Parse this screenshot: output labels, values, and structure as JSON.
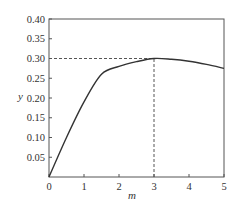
{
  "chart_data": {
    "type": "line",
    "title": "",
    "xlabel": "m",
    "ylabel": "y",
    "xlim": [
      0,
      5
    ],
    "ylim": [
      0,
      0.4
    ],
    "grid": false,
    "legend": null,
    "x_ticks": [
      "0",
      "1",
      "2",
      "3",
      "4",
      "5"
    ],
    "y_ticks": [
      "0.05",
      "0.10",
      "0.15",
      "0.20",
      "0.25",
      "0.30",
      "0.35",
      "0.40"
    ],
    "series": [
      {
        "name": "y(m)",
        "x": [
          0,
          0.5,
          1.0,
          1.5,
          2.0,
          2.5,
          3.0,
          3.5,
          4.0,
          4.5,
          5.0
        ],
        "values": [
          0,
          0.1,
          0.19,
          0.26,
          0.28,
          0.292,
          0.3,
          0.298,
          0.293,
          0.285,
          0.275
        ]
      }
    ],
    "annotations": [
      {
        "type": "dashed-hline",
        "y": 0.3,
        "x_from": 0,
        "x_to": 3
      },
      {
        "type": "dashed-vline",
        "x": 3,
        "y_from": 0,
        "y_to": 0.3
      }
    ]
  }
}
